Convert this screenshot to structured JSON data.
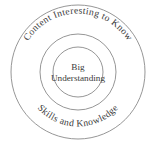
{
  "diagram": {
    "background_color": "#ffffff",
    "stroke_color": "#8a8a8a",
    "text_color": "#3a3a3a",
    "rings": [
      {
        "id": "outer",
        "radius": 67,
        "top_label": "Content Interesting to Know",
        "bottom_label": "Skills and Knowledge"
      },
      {
        "id": "middle",
        "radius": 38,
        "label": ""
      },
      {
        "id": "inner",
        "radius": 25,
        "label_line1": "Big",
        "label_line2": "Understanding"
      }
    ],
    "center": {
      "x": 78,
      "y": 72
    }
  }
}
